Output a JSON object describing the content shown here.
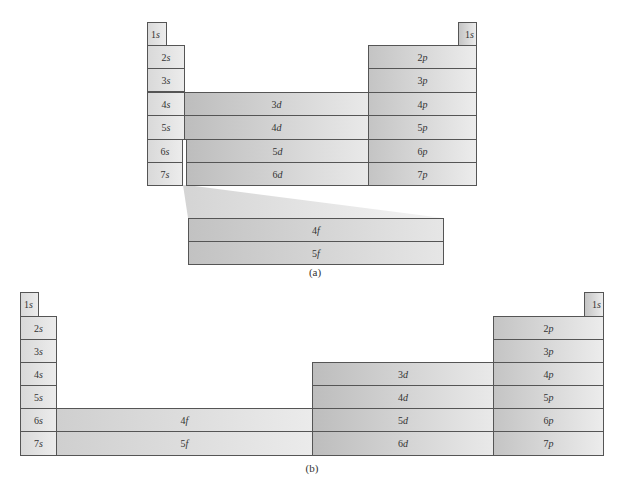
{
  "figure_a": {
    "caption": "(a)",
    "s_block": [
      {
        "n": "1",
        "l": "s"
      },
      {
        "n": "2",
        "l": "s"
      },
      {
        "n": "3",
        "l": "s"
      },
      {
        "n": "4",
        "l": "s"
      },
      {
        "n": "5",
        "l": "s"
      },
      {
        "n": "6",
        "l": "s"
      },
      {
        "n": "7",
        "l": "s"
      }
    ],
    "he_1s": {
      "n": "1",
      "l": "s"
    },
    "d_block": [
      {
        "n": "3",
        "l": "d"
      },
      {
        "n": "4",
        "l": "d"
      },
      {
        "n": "5",
        "l": "d"
      },
      {
        "n": "6",
        "l": "d"
      }
    ],
    "p_block": [
      {
        "n": "2",
        "l": "p"
      },
      {
        "n": "3",
        "l": "p"
      },
      {
        "n": "4",
        "l": "p"
      },
      {
        "n": "5",
        "l": "p"
      },
      {
        "n": "6",
        "l": "p"
      },
      {
        "n": "7",
        "l": "p"
      }
    ],
    "f_block": [
      {
        "n": "4",
        "l": "f"
      },
      {
        "n": "5",
        "l": "f"
      }
    ]
  },
  "figure_b": {
    "caption": "(b)",
    "s_block": [
      {
        "n": "1",
        "l": "s"
      },
      {
        "n": "2",
        "l": "s"
      },
      {
        "n": "3",
        "l": "s"
      },
      {
        "n": "4",
        "l": "s"
      },
      {
        "n": "5",
        "l": "s"
      },
      {
        "n": "6",
        "l": "s"
      },
      {
        "n": "7",
        "l": "s"
      }
    ],
    "he_1s": {
      "n": "1",
      "l": "s"
    },
    "f_block": [
      {
        "n": "4",
        "l": "f"
      },
      {
        "n": "5",
        "l": "f"
      }
    ],
    "d_block": [
      {
        "n": "3",
        "l": "d"
      },
      {
        "n": "4",
        "l": "d"
      },
      {
        "n": "5",
        "l": "d"
      },
      {
        "n": "6",
        "l": "d"
      }
    ],
    "p_block": [
      {
        "n": "2",
        "l": "p"
      },
      {
        "n": "3",
        "l": "p"
      },
      {
        "n": "4",
        "l": "p"
      },
      {
        "n": "5",
        "l": "p"
      },
      {
        "n": "6",
        "l": "p"
      },
      {
        "n": "7",
        "l": "p"
      }
    ]
  }
}
